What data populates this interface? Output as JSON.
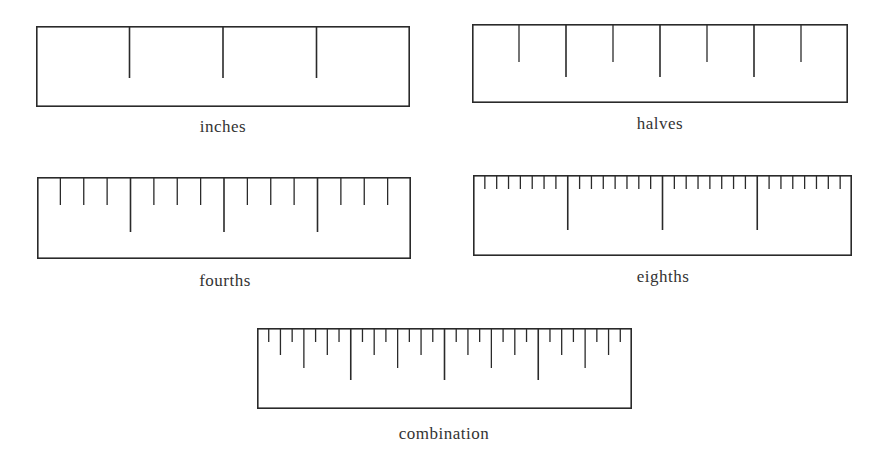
{
  "figure": {
    "rulers": [
      {
        "id": "inches",
        "caption": "inches",
        "box": {
          "x": 36,
          "y": 26,
          "w": 374,
          "h": 81
        },
        "inches": 4,
        "subdivisions": [
          {
            "level": "inch",
            "divisions": 1,
            "length": 52
          }
        ],
        "caption_pos": {
          "x": 123,
          "y": 117
        }
      },
      {
        "id": "halves",
        "caption": "halves",
        "box": {
          "x": 472,
          "y": 24,
          "w": 376,
          "h": 79
        },
        "inches": 4,
        "subdivisions": [
          {
            "level": "inch",
            "divisions": 1,
            "length": 53
          },
          {
            "level": "half",
            "divisions": 2,
            "length": 38
          }
        ],
        "caption_pos": {
          "x": 560,
          "y": 114
        }
      },
      {
        "id": "fourths",
        "caption": "fourths",
        "box": {
          "x": 37,
          "y": 177,
          "w": 374,
          "h": 82
        },
        "inches": 4,
        "subdivisions": [
          {
            "level": "inch",
            "divisions": 1,
            "length": 55
          },
          {
            "level": "quarter",
            "divisions": 4,
            "length": 28
          }
        ],
        "caption_pos": {
          "x": 125,
          "y": 271
        }
      },
      {
        "id": "eighths",
        "caption": "eighths",
        "box": {
          "x": 473,
          "y": 175,
          "w": 379,
          "h": 81
        },
        "inches": 4,
        "subdivisions": [
          {
            "level": "inch",
            "divisions": 1,
            "length": 55
          },
          {
            "level": "eighth",
            "divisions": 8,
            "length": 14
          }
        ],
        "caption_pos": {
          "x": 563,
          "y": 267
        }
      },
      {
        "id": "combination",
        "caption": "combination",
        "box": {
          "x": 257,
          "y": 328,
          "w": 375,
          "h": 81
        },
        "inches": 4,
        "subdivisions": [
          {
            "level": "inch",
            "divisions": 1,
            "length": 52
          },
          {
            "level": "half",
            "divisions": 2,
            "length": 40
          },
          {
            "level": "quarter",
            "divisions": 4,
            "length": 27
          },
          {
            "level": "eighth",
            "divisions": 8,
            "length": 14
          }
        ],
        "caption_pos": {
          "x": 344,
          "y": 424
        }
      }
    ]
  }
}
